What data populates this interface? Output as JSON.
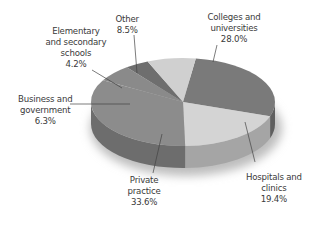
{
  "chart_data": {
    "type": "pie",
    "style": "3d",
    "title": "",
    "slices": [
      {
        "label": "Colleges and universities",
        "value": 28.0,
        "display": "28.0%",
        "color": "#7a7a7a"
      },
      {
        "label": "Hospitals and clinics",
        "value": 19.4,
        "display": "19.4%",
        "color": "#d4d4d4"
      },
      {
        "label": "Private practice",
        "value": 33.6,
        "display": "33.6%",
        "color": "#8c8c8c"
      },
      {
        "label": "Business and government",
        "value": 6.3,
        "display": "6.3%",
        "color": "#8a8a8a"
      },
      {
        "label": "Elementary and secondary schools",
        "value": 4.2,
        "display": "4.2%",
        "color": "#6e6e6e"
      },
      {
        "label": "Other",
        "value": 8.5,
        "display": "8.5%",
        "color": "#d0d0d0"
      }
    ],
    "start_angle_deg": -82,
    "direction": "clockwise",
    "labels": [
      {
        "lines": [
          "Colleges and",
          "universities",
          "28.0%"
        ]
      },
      {
        "lines": [
          "Hospitals and",
          "clinics",
          "19.4%"
        ]
      },
      {
        "lines": [
          "Private",
          "practice",
          "33.6%"
        ]
      },
      {
        "lines": [
          "Business and",
          "government",
          "6.3%"
        ]
      },
      {
        "lines": [
          "Elementary",
          "and secondary",
          "schools",
          "4.2%"
        ]
      },
      {
        "lines": [
          "Other",
          "8.5%"
        ]
      }
    ],
    "legend": "none"
  }
}
